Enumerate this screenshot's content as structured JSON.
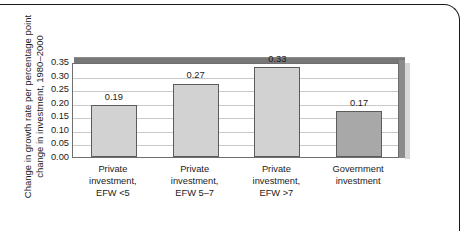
{
  "chart_data": {
    "type": "bar",
    "title": "",
    "subtitle": "",
    "xlabel": "",
    "ylabel": "Change in growth rate per percentage point\nchange in investment, 1980–2000",
    "categories": [
      "Private\ninvestment,\nEFW <5",
      "Private\ninvestment,\nEFW 5–7",
      "Private\ninvestment,\nEFW >7",
      "Government\ninvestment"
    ],
    "values": [
      0.19,
      0.27,
      0.33,
      0.17
    ],
    "data_labels": [
      "0.19",
      "0.27",
      "0.33",
      "0.17"
    ],
    "ylim": [
      0.0,
      0.35
    ],
    "ytick_step": 0.05,
    "ytick_labels": [
      "0.35",
      "0.30",
      "0.25",
      "0.20",
      "0.15",
      "0.10",
      "0.05",
      "0.00"
    ],
    "ytick_values": [
      0.35,
      0.3,
      0.25,
      0.2,
      0.15,
      0.1,
      0.05,
      0.0
    ],
    "grid": true,
    "legend": false,
    "legend_position": "none",
    "bar_colors": [
      "#d2d2d2",
      "#d2d2d2",
      "#d2d2d2",
      "#a8a8a8"
    ],
    "bar_border_color": "#5c5c5c",
    "gridline_color": "#c9c9c9",
    "plot_border_color": "#6e6e6e",
    "top_band_color": "#777777",
    "shadow_color": "#8b8b8b",
    "text_color": "#1b1b1b",
    "background_color": "#ffffff",
    "frame_color": "#1a1a1a"
  }
}
